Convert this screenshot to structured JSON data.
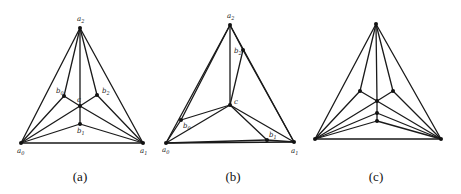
{
  "figures": [
    {
      "id": "a",
      "caption": "(a)",
      "caption_pos": [
        80,
        181
      ],
      "nodes": [
        {
          "name": "a2",
          "label": "a2",
          "x": 80,
          "y": 28,
          "lx": -3,
          "ly": -7
        },
        {
          "name": "a0",
          "label": "a0",
          "x": 21,
          "y": 143,
          "lx": -4,
          "ly": 10
        },
        {
          "name": "a1",
          "label": "a1",
          "x": 143,
          "y": 143,
          "lx": -3,
          "ly": 10
        },
        {
          "name": "b0",
          "label": "b0",
          "x": 64,
          "y": 96,
          "lx": -8,
          "ly": -3
        },
        {
          "name": "b2",
          "label": "b2",
          "x": 97,
          "y": 95,
          "lx": 5,
          "ly": -2
        },
        {
          "name": "c",
          "label": "c",
          "x": 80,
          "y": 106,
          "lx": -3,
          "ly": -4
        },
        {
          "name": "b1",
          "label": "b1",
          "x": 80,
          "y": 124,
          "lx": -3,
          "ly": 9
        }
      ],
      "edges": [
        [
          "a0",
          "a1"
        ],
        [
          "a0",
          "a2"
        ],
        [
          "a1",
          "a2"
        ],
        [
          "a2",
          "b0"
        ],
        [
          "a2",
          "c"
        ],
        [
          "a2",
          "b2"
        ],
        [
          "b0",
          "c"
        ],
        [
          "b2",
          "c"
        ],
        [
          "c",
          "b1"
        ],
        [
          "a0",
          "b0"
        ],
        [
          "a0",
          "c"
        ],
        [
          "a0",
          "b1"
        ],
        [
          "a1",
          "b2"
        ],
        [
          "a1",
          "c"
        ],
        [
          "a1",
          "b1"
        ]
      ]
    },
    {
      "id": "b",
      "caption": "(b)",
      "caption_pos": [
        233,
        181
      ],
      "nodes": [
        {
          "name": "a2",
          "label": "a2",
          "x": 230,
          "y": 25,
          "lx": -3,
          "ly": -7
        },
        {
          "name": "a0",
          "label": "a0",
          "x": 166,
          "y": 143,
          "lx": -4,
          "ly": 9
        },
        {
          "name": "a1",
          "label": "a1",
          "x": 294,
          "y": 142,
          "lx": -3,
          "ly": 11
        },
        {
          "name": "b2",
          "label": "b2",
          "x": 243,
          "y": 50,
          "lx": -9,
          "ly": 3
        },
        {
          "name": "c",
          "label": "c",
          "x": 230,
          "y": 105,
          "lx": 4,
          "ly": -1
        },
        {
          "name": "b0",
          "label": "b0",
          "x": 181,
          "y": 120,
          "lx": 2,
          "ly": 8
        },
        {
          "name": "b1",
          "label": "b1",
          "x": 267,
          "y": 140,
          "lx": 2,
          "ly": -3
        }
      ],
      "edges": [
        [
          "a0",
          "a1"
        ],
        [
          "a0",
          "a2"
        ],
        [
          "a1",
          "a2"
        ],
        [
          "a2",
          "c"
        ],
        [
          "a2",
          "b2"
        ],
        [
          "b2",
          "a1"
        ],
        [
          "b2",
          "c"
        ],
        [
          "a0",
          "b0"
        ],
        [
          "b0",
          "a2"
        ],
        [
          "b0",
          "c"
        ],
        [
          "a0",
          "c"
        ],
        [
          "c",
          "a1"
        ],
        [
          "c",
          "b1"
        ],
        [
          "a0",
          "b1"
        ],
        [
          "b1",
          "a1"
        ]
      ]
    },
    {
      "id": "c",
      "caption": "(c)",
      "caption_pos": [
        376,
        181
      ],
      "nodes": [
        {
          "name": "top",
          "label": "",
          "x": 376,
          "y": 24
        },
        {
          "name": "left",
          "label": "",
          "x": 315,
          "y": 139
        },
        {
          "name": "right",
          "label": "",
          "x": 441,
          "y": 139
        },
        {
          "name": "bl",
          "label": "",
          "x": 360,
          "y": 91
        },
        {
          "name": "br",
          "label": "",
          "x": 393,
          "y": 91
        },
        {
          "name": "m1",
          "label": "",
          "x": 377,
          "y": 101
        },
        {
          "name": "m2",
          "label": "",
          "x": 377,
          "y": 113
        },
        {
          "name": "m3",
          "label": "",
          "x": 377,
          "y": 121
        }
      ],
      "edges": [
        [
          "left",
          "right"
        ],
        [
          "left",
          "top"
        ],
        [
          "right",
          "top"
        ],
        [
          "top",
          "bl"
        ],
        [
          "top",
          "br"
        ],
        [
          "top",
          "m1"
        ],
        [
          "bl",
          "m1"
        ],
        [
          "br",
          "m1"
        ],
        [
          "m1",
          "m2"
        ],
        [
          "m2",
          "m3"
        ],
        [
          "left",
          "bl"
        ],
        [
          "left",
          "m1"
        ],
        [
          "left",
          "m2"
        ],
        [
          "left",
          "m3"
        ],
        [
          "right",
          "br"
        ],
        [
          "right",
          "m1"
        ],
        [
          "right",
          "m2"
        ],
        [
          "right",
          "m3"
        ]
      ]
    }
  ]
}
